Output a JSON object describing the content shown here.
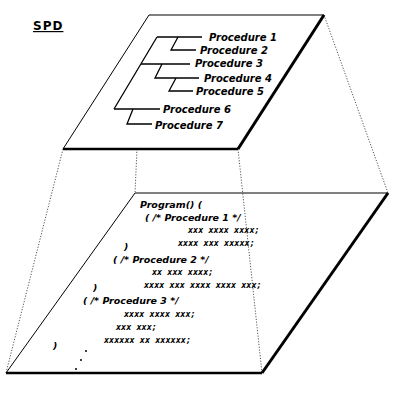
{
  "diagram": {
    "title": "SPD",
    "structure_plane": {
      "procedures": [
        {
          "label": "Procedure 1",
          "level": 2
        },
        {
          "label": "Procedure 2",
          "level": 3
        },
        {
          "label": "Procedure 3",
          "level": 1
        },
        {
          "label": "Procedure 4",
          "level": 2
        },
        {
          "label": "Procedure 5",
          "level": 3
        },
        {
          "label": "Procedure 6",
          "level": 1
        },
        {
          "label": "Procedure 7",
          "level": 2
        }
      ]
    },
    "code_plane": {
      "lines": [
        "Program() (",
        "( /*  Procedure 1  */",
        "xxx xxxx xxxx;",
        "xxxx xxx xxxxx;",
        ")",
        "( /*  Procedure 2  */",
        "xx xxx  xxxx;",
        "xxxx xxx   xxxx xxxx xxx;",
        ")",
        "( /*  Procedure 3  */",
        "xxxx xxxx xxx;",
        "xxx xxx;",
        "xxxxxx xx  xxxxxx;",
        ")"
      ],
      "continuation": "ellipsis-dots"
    }
  }
}
